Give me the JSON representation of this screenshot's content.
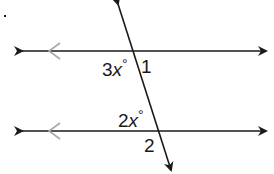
{
  "diagram": {
    "colors": {
      "line": "#1a1a1a",
      "parallel_mark": "#a8a8a8"
    },
    "labels": {
      "angle_top_left_coef": "3",
      "angle_top_left_var": "x",
      "angle_top_left_deg": "°",
      "angle_1": "1",
      "angle_bottom_left_coef": "2",
      "angle_bottom_left_var": "x",
      "angle_bottom_left_deg": "°",
      "angle_2": "2"
    },
    "bullet": "."
  }
}
